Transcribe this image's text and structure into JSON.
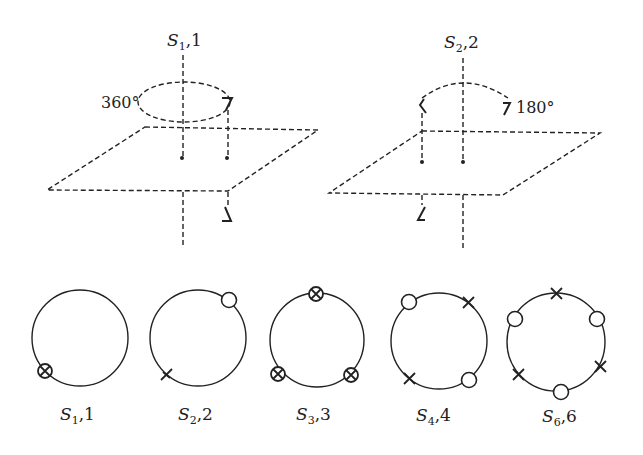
{
  "top_diagrams": [
    {
      "axis_label_S": "S",
      "axis_label_sub": "1",
      "axis_label_rest": ",1",
      "angle_label": "360°"
    },
    {
      "axis_label_S": "S",
      "axis_label_sub": "2",
      "axis_label_rest": ",2",
      "angle_label": "180°"
    }
  ],
  "circles": [
    {
      "S": "S",
      "sub": "1",
      "rest": ",1",
      "markers": "1 ⊗"
    },
    {
      "S": "S",
      "sub": "2",
      "rest": ",2",
      "markers": "1 ○, 1 ×"
    },
    {
      "S": "S",
      "sub": "3",
      "rest": ",3",
      "markers": "3 ⊗"
    },
    {
      "S": "S",
      "sub": "4",
      "rest": ",4",
      "markers": "2 ○, 2 ×"
    },
    {
      "S": "S",
      "sub": "6",
      "rest": ",6",
      "markers": "3 ○, 3 ×"
    }
  ]
}
